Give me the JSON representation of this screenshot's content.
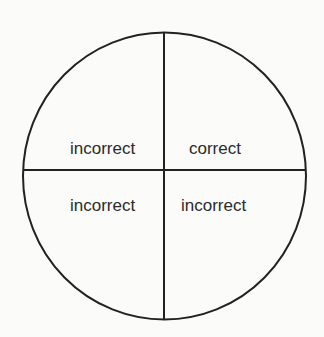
{
  "diagram": {
    "shape": "circle divided into four quadrants",
    "quadrants": {
      "top_left": "incorrect",
      "top_right": "correct",
      "bottom_left": "incorrect",
      "bottom_right": "incorrect"
    },
    "colors": {
      "stroke": "#222222",
      "text": "#2b2b2b",
      "background": "#fbfbfa"
    }
  }
}
